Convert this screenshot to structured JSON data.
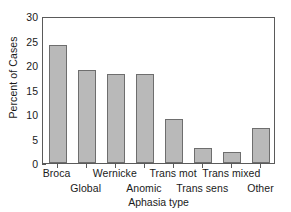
{
  "chart_data": {
    "type": "bar",
    "title": "",
    "subtitle": "",
    "xlabel": "Aphasia type",
    "ylabel": "Percent of Cases",
    "categories": [
      "Broca",
      "Global",
      "Wernicke",
      "Anomic",
      "Trans mot",
      "Trans sens",
      "Trans mixed",
      "Other"
    ],
    "values": [
      24.0,
      19.0,
      18.2,
      18.2,
      9.0,
      3.1,
      2.3,
      7.2
    ],
    "ylim": [
      0,
      30
    ],
    "yticks": [
      0,
      5,
      10,
      15,
      20,
      25,
      30
    ],
    "ytick_labels": [
      "0",
      "5",
      "10",
      "15",
      "20",
      "25",
      "30"
    ],
    "y_minor_ticks": [
      2.5,
      7.5,
      12.5,
      17.5,
      22.5,
      27.5
    ],
    "grid": false,
    "legend": null,
    "legend_position": "none",
    "bar_fill_color": "#b9b9b9",
    "bar_edge_color": "#6e6e6e",
    "axis_color": "#5a5a5a",
    "label_rows": [
      0,
      1,
      0,
      1,
      0,
      1,
      0,
      1
    ],
    "annotations": []
  },
  "figure": {
    "background_color": "#ffffff",
    "text_color": "#1a1a1a"
  }
}
